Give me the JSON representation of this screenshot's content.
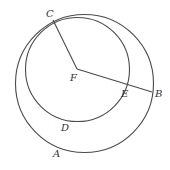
{
  "diagram": {
    "type": "geometry",
    "stroke_color": "#4a4a4a",
    "label_color": "#333333",
    "circles": [
      {
        "name": "outer",
        "cx": 84.5,
        "cy": 83.5,
        "r": 69
      },
      {
        "name": "inner",
        "cx": 77.5,
        "cy": 69.5,
        "r": 52
      }
    ],
    "segments": [
      {
        "name": "FC",
        "from": "F",
        "to": "C"
      },
      {
        "name": "FB",
        "from": "F",
        "to": "B"
      }
    ],
    "points": {
      "A": {
        "label": "A",
        "x": 53,
        "y": 157
      },
      "B": {
        "label": "B",
        "x": 155,
        "y": 97
      },
      "C": {
        "label": "C",
        "x": 46,
        "y": 17
      },
      "D": {
        "label": "D",
        "x": 61,
        "y": 131
      },
      "E": {
        "label": "E",
        "x": 121,
        "y": 97
      },
      "F": {
        "label": "F",
        "x": 70,
        "y": 81
      }
    }
  }
}
